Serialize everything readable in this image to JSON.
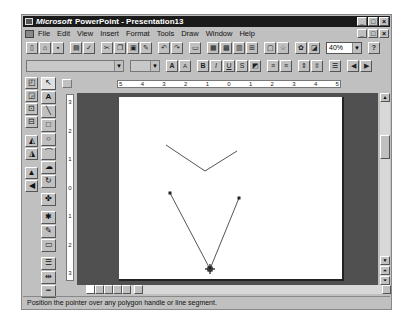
{
  "titlebar": {
    "brand": "Microsoft",
    "title": "PowerPoint - Presentation13"
  },
  "window_buttons": [
    "_",
    "□",
    "×"
  ],
  "menubar": {
    "items": [
      {
        "label": "File"
      },
      {
        "label": "Edit"
      },
      {
        "label": "View"
      },
      {
        "label": "Insert"
      },
      {
        "label": "Format"
      },
      {
        "label": "Tools"
      },
      {
        "label": "Draw"
      },
      {
        "label": "Window"
      },
      {
        "label": "Help"
      }
    ]
  },
  "standard_toolbar": {
    "buttons": [
      "new",
      "open",
      "save",
      "print",
      "spelling",
      "cut",
      "copy",
      "paste",
      "format-painter",
      "undo",
      "redo",
      "insert-new-slide",
      "insert-word-table",
      "insert-excel-worksheet",
      "insert-graph",
      "insert-clip-art",
      "apply-design",
      "animation-effects",
      "report-it",
      "black-and-white-view"
    ],
    "zoom": "40%",
    "help_label": "?"
  },
  "formatting_toolbar": {
    "font_name": "",
    "font_size": "",
    "buttons": [
      "increase-font-size",
      "decrease-font-size",
      "bold",
      "italic",
      "underline",
      "shadow",
      "text-color",
      "align-left",
      "center",
      "increase-paragraph-spacing",
      "decrease-paragraph-spacing",
      "bullets",
      "promote",
      "demote"
    ]
  },
  "drawing_toolbar": {
    "items": [
      "bring-to-front",
      "send-to-back",
      "group",
      "ungroup",
      "rotate",
      "flip",
      "align",
      "shadow-on-off"
    ]
  },
  "drawing_tools": {
    "items": [
      "selection",
      "text",
      "line",
      "rectangle",
      "ellipse",
      "arc",
      "freeform",
      "free-rotate",
      "autoshapes",
      "fill-color",
      "line-color",
      "shadow",
      "line-style",
      "arrowheads",
      "dashed-lines"
    ]
  },
  "ruler": {
    "horizontal": [
      "5",
      "4",
      "3",
      "2",
      "1",
      "0",
      "1",
      "2",
      "3",
      "4",
      "5"
    ],
    "vertical": [
      "3",
      "2",
      "1",
      "0",
      "1",
      "2",
      "3"
    ]
  },
  "slide": {
    "shapes": [
      {
        "type": "polyline",
        "points": "43,28 82,54 116,34",
        "selected": false
      },
      {
        "type": "polyline",
        "points": "47,76 87,153 116,81",
        "selected": true
      }
    ],
    "cursor": "move-handle-cursor"
  },
  "view_buttons": [
    "slide-view",
    "outline-view",
    "slide-sorter-view",
    "notes-page-view",
    "slide-show"
  ],
  "statusbar": {
    "text": "Position the pointer over any polygon handle or line segment."
  }
}
